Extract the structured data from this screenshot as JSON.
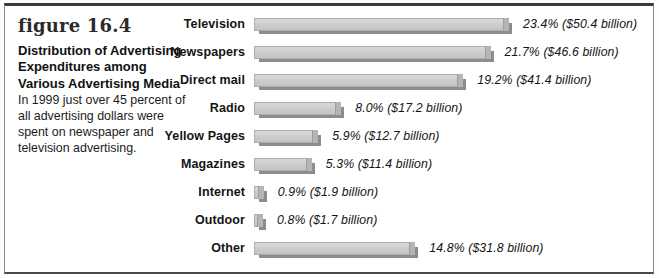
{
  "figure": {
    "label": "figure 16.4",
    "title": "Distribution of Advertising Expenditures among Various Advertising Media",
    "caption": "In 1999 just over 45 percent of all advertising dollars were spent on newspaper and television advertising."
  },
  "chart_data": {
    "type": "bar",
    "orientation": "horizontal",
    "categories": [
      "Television",
      "Newspapers",
      "Direct mail",
      "Radio",
      "Yellow Pages",
      "Magazines",
      "Internet",
      "Outdoor",
      "Other"
    ],
    "values": [
      23.4,
      21.7,
      19.2,
      8.0,
      5.9,
      5.3,
      0.9,
      0.8,
      14.8
    ],
    "dollar_billions": [
      50.4,
      46.6,
      41.4,
      17.2,
      12.7,
      11.4,
      1.9,
      1.7,
      31.8
    ],
    "value_labels": [
      "23.4% ($50.4 billion)",
      "21.7% ($46.6 billion)",
      "19.2% ($41.4 billion)",
      "8.0% ($17.2 billion)",
      "5.9% ($12.7 billion)",
      "5.3% ($11.4 billion)",
      "0.9% ($1.9 billion)",
      "0.8% ($1.7 billion)",
      "14.8% ($31.8 billion)"
    ],
    "unit": "percent of total advertising dollars",
    "xlim": [
      0,
      25
    ],
    "grid": false,
    "legend": false,
    "bar_color": "#cbcbcb",
    "bar_shadow_color": "#8d8d8d",
    "bar_cap_color": "#b5b5b5",
    "text_color": "#141414"
  }
}
